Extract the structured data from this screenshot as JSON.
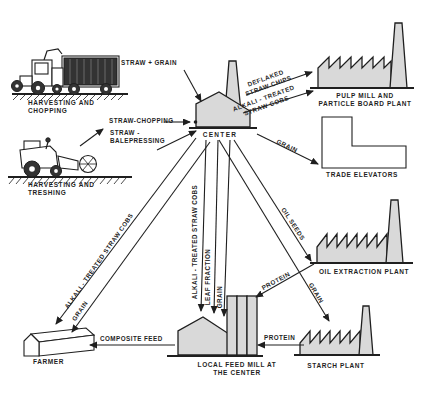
{
  "diagram": {
    "colors": {
      "bg": "#ffffff",
      "ink": "#1f1f1f",
      "building-fill": "#d9d9d9",
      "load-fill": "#333333"
    },
    "nodes": {
      "harvesting_chopping": {
        "line1": "HARVESTING AND",
        "line2": "CHOPPING"
      },
      "harvesting_threshing": {
        "line1": "HARVESTING AND",
        "line2": "TRESHING"
      },
      "center": {
        "label": "CENTER"
      },
      "pulp_mill": {
        "line1": "PULP MILL AND",
        "line2": "PARTICLE BOARD PLANT"
      },
      "trade_elevators": {
        "label": "TRADE ELEVATORS"
      },
      "oil_extraction": {
        "label": "OIL EXTRACTION PLANT"
      },
      "starch_plant": {
        "label": "STARCH PLANT"
      },
      "feed_mill": {
        "line1": "LOCAL FEED MILL AT",
        "line2": "THE CENTER"
      },
      "farmer": {
        "label": "FARMER"
      }
    },
    "flows": {
      "straw_grain": {
        "label": "STRAW + GRAIN"
      },
      "straw_chopping": {
        "label": "STRAW-CHOPPING"
      },
      "straw_balepressing": {
        "line1": "STRAW -",
        "line2": "BALEPRESSING"
      },
      "deflaked_straw_chips": {
        "line1": "DEFLAKED",
        "line2": "STRAW CHIPS"
      },
      "alkali_to_pulp": {
        "line1": "ALKALI - TREATED",
        "line2": "STRAW COBS"
      },
      "grain_to_elevators": {
        "label": "GRAIN"
      },
      "oil_seeds": {
        "label": "OIL SEEDS"
      },
      "grain_to_starch": {
        "label": "GRAIN"
      },
      "protein_from_oil": {
        "label": "PROTEIN"
      },
      "protein_from_starch": {
        "label": "PROTEIN"
      },
      "alkali_to_farmer": {
        "label": "ALKALI - TREATED STRAW COBS"
      },
      "grain_to_farmer": {
        "label": "GRAIN"
      },
      "alkali_to_feedmill": {
        "label": "ALKALI - TREATED STRAW COBS"
      },
      "leaf_fraction": {
        "label": "LEAF FRACTION"
      },
      "grain_to_feedmill": {
        "label": "GRAIN"
      },
      "composite_feed": {
        "label": "COMPOSITE FEED"
      }
    }
  }
}
